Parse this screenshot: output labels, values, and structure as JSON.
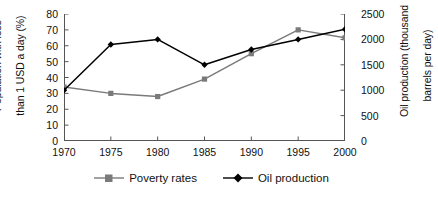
{
  "chart_data": {
    "type": "line",
    "title": "",
    "xlabel": "",
    "categories": [
      "1970",
      "1975",
      "1980",
      "1985",
      "1990",
      "1995",
      "2000"
    ],
    "x": [
      1970,
      1975,
      1980,
      1985,
      1990,
      1995,
      2000
    ],
    "grid": false,
    "legend_position": "bottom-center",
    "axes": {
      "x": {
        "ticks": [
          "1970",
          "1975",
          "1980",
          "1985",
          "1990",
          "1995",
          "2000"
        ],
        "xlim": [
          1970,
          2000
        ]
      },
      "y_left": {
        "label": "Population with less than 1 USD a day (%)",
        "label_line1": "Population with less",
        "label_line2": "than 1 USD a day (%)",
        "ticks": [
          "0",
          "10",
          "20",
          "30",
          "40",
          "50",
          "60",
          "70",
          "80"
        ],
        "tick_values": [
          0,
          10,
          20,
          30,
          40,
          50,
          60,
          70,
          80
        ],
        "ylim": [
          0,
          80
        ]
      },
      "y_right": {
        "label": "Oil production (thousand barrels per day)",
        "label_line1": "Oil production (thousand",
        "label_line2": "barrels per day)",
        "ticks": [
          "0",
          "500",
          "1000",
          "1500",
          "2000",
          "2500"
        ],
        "tick_values": [
          0,
          500,
          1000,
          1500,
          2000,
          2500
        ],
        "ylim": [
          0,
          2500
        ]
      }
    },
    "series": [
      {
        "name": "Poverty rates",
        "axis": "y_left",
        "color": "#7a7a7a",
        "marker": "square",
        "values": [
          34,
          30,
          28,
          39,
          55,
          70,
          65
        ]
      },
      {
        "name": "Oil production",
        "axis": "y_right",
        "color": "#000000",
        "marker": "diamond",
        "values": [
          1000,
          1900,
          2000,
          1500,
          1800,
          2000,
          2200
        ]
      }
    ]
  },
  "legend": {
    "items": [
      {
        "label": "Poverty rates",
        "marker": "square-marker",
        "color": "#7a7a7a"
      },
      {
        "label": "Oil production",
        "marker": "diamond-marker",
        "color": "#000000"
      }
    ]
  }
}
